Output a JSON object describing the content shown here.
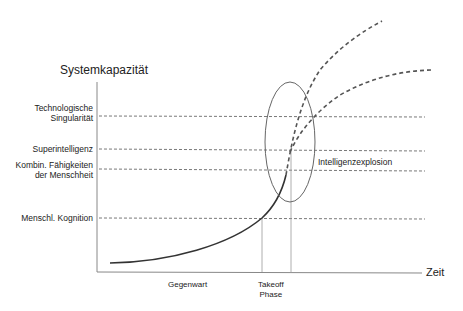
{
  "diagram": {
    "y_axis_title": "Systemkapazität",
    "x_axis_title": "Zeit",
    "levels": [
      {
        "id": "singularity",
        "label_line1": "Technologische",
        "label_line2": "Singularität"
      },
      {
        "id": "superintelligence",
        "label_line1": "Superintelligenz",
        "label_line2": ""
      },
      {
        "id": "humanity",
        "label_line1": "Kombin. Fähigkeiten",
        "label_line2": "der Menschheit"
      },
      {
        "id": "human-cognition",
        "label_line1": "Menschl. Kognition",
        "label_line2": ""
      }
    ],
    "x_labels": {
      "present": "Gegenwart",
      "takeoff_line1": "Takeoff",
      "takeoff_line2": "Phase"
    },
    "annotation": "Intelligenzexplosion",
    "colors": {
      "axis": "#888888",
      "curve": "#333333",
      "dashed": "#555555",
      "ellipse": "#666666"
    }
  }
}
